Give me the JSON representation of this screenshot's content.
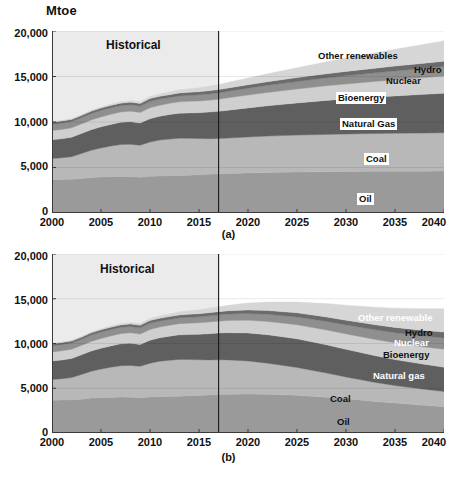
{
  "figure": {
    "unit_label": "Mtoe",
    "historical_label": "Historical",
    "captions": {
      "a": "(a)",
      "b": "(b)"
    }
  },
  "chart_data": [
    {
      "id": "panel-a",
      "type": "area",
      "stacked": true,
      "title": "",
      "caption": "(a)",
      "xlabel": "",
      "ylabel": "Mtoe",
      "unit": "Mtoe",
      "xlim": [
        2000,
        2040
      ],
      "ylim": [
        0,
        20000
      ],
      "yticks": [
        0,
        5000,
        10000,
        15000,
        20000
      ],
      "ytick_labels": [
        "0",
        "5,000",
        "10,000",
        "15,000",
        "20,000"
      ],
      "xticks": [
        2000,
        2005,
        2010,
        2015,
        2020,
        2025,
        2030,
        2035,
        2040
      ],
      "xtick_labels": [
        "2000",
        "2005",
        "2010",
        "2015",
        "2020",
        "2025",
        "2030",
        "2035",
        "2040"
      ],
      "grid": false,
      "legend_position": "inline-annotations",
      "historical_divider_year": 2017,
      "historical_shading": true,
      "x": [
        2000,
        2001,
        2002,
        2003,
        2004,
        2005,
        2006,
        2007,
        2008,
        2009,
        2010,
        2011,
        2012,
        2013,
        2014,
        2015,
        2016,
        2017,
        2018,
        2020,
        2022,
        2025,
        2028,
        2030,
        2033,
        2035,
        2038,
        2040
      ],
      "series": [
        {
          "name": "Oil",
          "color": "#9a9a9a",
          "label_anchor": {
            "x": 2028,
            "y": 1800
          },
          "values": [
            3660,
            3690,
            3710,
            3780,
            3900,
            3950,
            3980,
            4010,
            3990,
            3930,
            4030,
            4060,
            4090,
            4120,
            4160,
            4200,
            4250,
            4300,
            4340,
            4400,
            4450,
            4500,
            4540,
            4560,
            4580,
            4590,
            4600,
            4620
          ]
        },
        {
          "name": "Coal",
          "color": "#b8b8b8",
          "label_anchor": {
            "x": 2029,
            "y": 6500
          },
          "values": [
            2320,
            2370,
            2480,
            2750,
            2990,
            3190,
            3370,
            3510,
            3560,
            3520,
            3760,
            3960,
            4030,
            4100,
            4050,
            3980,
            3920,
            3880,
            3900,
            3950,
            4000,
            4060,
            4100,
            4120,
            4150,
            4170,
            4190,
            4200
          ]
        },
        {
          "name": "Natural Gas",
          "color": "#5f5f5f",
          "label_anchor": {
            "x": 2027,
            "y": 10000
          },
          "values": [
            2070,
            2100,
            2140,
            2200,
            2270,
            2330,
            2380,
            2450,
            2490,
            2440,
            2580,
            2620,
            2700,
            2750,
            2790,
            2840,
            2920,
            2990,
            3060,
            3200,
            3340,
            3530,
            3730,
            3850,
            4010,
            4110,
            4250,
            4340
          ]
        },
        {
          "name": "Bioenergy",
          "color": "#cfcfcf",
          "label_anchor": {
            "x": 2026,
            "y": 12600
          },
          "values": [
            1010,
            1020,
            1030,
            1050,
            1070,
            1090,
            1110,
            1130,
            1150,
            1160,
            1190,
            1210,
            1230,
            1250,
            1270,
            1290,
            1310,
            1330,
            1360,
            1410,
            1460,
            1530,
            1600,
            1650,
            1720,
            1770,
            1840,
            1890
          ]
        },
        {
          "name": "Nuclear",
          "color": "#8f8f8f",
          "label_anchor": {
            "x": 2032,
            "y": 14300
          },
          "values": [
            676,
            690,
            692,
            687,
            714,
            721,
            728,
            709,
            712,
            703,
            719,
            674,
            642,
            646,
            662,
            679,
            688,
            700,
            715,
            745,
            775,
            820,
            865,
            895,
            940,
            970,
            1015,
            1045
          ]
        },
        {
          "name": "Hydro",
          "color": "#6b6b6b",
          "label_anchor": {
            "x": 2036,
            "y": 15400
          },
          "values": [
            225,
            229,
            232,
            238,
            245,
            251,
            258,
            265,
            276,
            281,
            295,
            298,
            314,
            326,
            335,
            340,
            349,
            358,
            368,
            388,
            408,
            438,
            468,
            488,
            518,
            538,
            568,
            588
          ]
        },
        {
          "name": "Other renewables",
          "color": "#d6d6d6",
          "label_anchor": {
            "x": 2025,
            "y": 16100
          },
          "values": [
            60,
            66,
            73,
            82,
            93,
            106,
            122,
            143,
            167,
            193,
            225,
            262,
            302,
            345,
            392,
            442,
            496,
            552,
            615,
            745,
            880,
            1090,
            1310,
            1460,
            1690,
            1845,
            2080,
            2240
          ]
        }
      ],
      "totals_note": "Total primary energy demand rises from about 9,980 Mtoe in 2000 to about 17,520 Mtoe in 2040",
      "annotations": [
        {
          "text": "Historical",
          "x": 2007,
          "y": 18600
        },
        {
          "text": "Other renewables",
          "x": 2027,
          "y": 16400
        },
        {
          "text": "Hydro",
          "x": 2038,
          "y": 15900
        },
        {
          "text": "Nuclear",
          "x": 2035,
          "y": 14900
        },
        {
          "text": "Bioenergy",
          "x": 2027,
          "y": 13000
        },
        {
          "text": "Natural Gas",
          "x": 2028,
          "y": 10300
        },
        {
          "text": "Coal",
          "x": 2031,
          "y": 6600
        },
        {
          "text": "Oil",
          "x": 2031,
          "y": 1900
        }
      ]
    },
    {
      "id": "panel-b",
      "type": "area",
      "stacked": true,
      "title": "",
      "caption": "(b)",
      "xlabel": "",
      "ylabel": "Mtoe",
      "unit": "Mtoe",
      "xlim": [
        2000,
        2040
      ],
      "ylim": [
        0,
        20000
      ],
      "yticks": [
        0,
        5000,
        10000,
        15000,
        20000
      ],
      "ytick_labels": [
        "0",
        "5,000",
        "10,000",
        "15,000",
        "20,000"
      ],
      "xticks": [
        2000,
        2005,
        2010,
        2015,
        2020,
        2025,
        2030,
        2035,
        2040
      ],
      "xtick_labels": [
        "2000",
        "2005",
        "2010",
        "2015",
        "2020",
        "2025",
        "2030",
        "2035",
        "2040"
      ],
      "grid": false,
      "legend_position": "inline-annotations",
      "historical_divider_year": 2017,
      "historical_shading": true,
      "x": [
        2000,
        2001,
        2002,
        2003,
        2004,
        2005,
        2006,
        2007,
        2008,
        2009,
        2010,
        2011,
        2012,
        2013,
        2014,
        2015,
        2016,
        2017,
        2018,
        2020,
        2022,
        2025,
        2028,
        2030,
        2033,
        2035,
        2038,
        2040
      ],
      "series": [
        {
          "name": "Oil",
          "color": "#9a9a9a",
          "label_anchor": {
            "x": 2028,
            "y": 1700
          },
          "values": [
            3660,
            3690,
            3710,
            3780,
            3900,
            3950,
            3980,
            4010,
            3990,
            3930,
            4030,
            4060,
            4090,
            4120,
            4160,
            4200,
            4250,
            4300,
            4330,
            4350,
            4320,
            4220,
            4000,
            3820,
            3530,
            3350,
            3100,
            2930
          ]
        },
        {
          "name": "Coal",
          "color": "#b8b8b8",
          "label_anchor": {
            "x": 2027,
            "y": 5700
          },
          "values": [
            2320,
            2370,
            2480,
            2750,
            2990,
            3190,
            3370,
            3510,
            3560,
            3520,
            3760,
            3960,
            4030,
            4100,
            4050,
            3980,
            3920,
            3880,
            3840,
            3700,
            3480,
            3100,
            2700,
            2440,
            2120,
            1950,
            1780,
            1700
          ]
        },
        {
          "name": "Natural Gas",
          "color": "#5f5f5f",
          "label_anchor": {
            "x": 2029,
            "y": 6800
          },
          "values": [
            2070,
            2100,
            2140,
            2200,
            2270,
            2330,
            2380,
            2450,
            2490,
            2440,
            2580,
            2620,
            2700,
            2750,
            2790,
            2840,
            2920,
            2990,
            3040,
            3130,
            3180,
            3200,
            3150,
            3090,
            2980,
            2900,
            2790,
            2720
          ]
        },
        {
          "name": "Bioenergy",
          "color": "#cfcfcf",
          "label_anchor": {
            "x": 2031,
            "y": 10700
          },
          "values": [
            1010,
            1020,
            1030,
            1050,
            1070,
            1090,
            1110,
            1130,
            1150,
            1160,
            1190,
            1210,
            1230,
            1250,
            1270,
            1290,
            1310,
            1330,
            1360,
            1420,
            1480,
            1570,
            1660,
            1720,
            1810,
            1870,
            1950,
            2010
          ]
        },
        {
          "name": "Nuclear",
          "color": "#8f8f8f",
          "label_anchor": {
            "x": 2033,
            "y": 11700
          },
          "values": [
            676,
            690,
            692,
            687,
            714,
            721,
            728,
            709,
            712,
            703,
            719,
            674,
            642,
            646,
            662,
            679,
            688,
            700,
            720,
            760,
            810,
            880,
            960,
            1010,
            1090,
            1140,
            1210,
            1260
          ]
        },
        {
          "name": "Hydro",
          "color": "#6b6b6b",
          "label_anchor": {
            "x": 2035,
            "y": 12600
          },
          "values": [
            225,
            229,
            232,
            238,
            245,
            251,
            258,
            265,
            276,
            281,
            295,
            298,
            314,
            326,
            335,
            340,
            349,
            358,
            370,
            395,
            420,
            460,
            500,
            525,
            565,
            590,
            630,
            655
          ]
        },
        {
          "name": "Other renewable",
          "color": "#d6d6d6",
          "label_anchor": {
            "x": 2032,
            "y": 13300
          },
          "values": [
            60,
            66,
            73,
            82,
            93,
            106,
            122,
            143,
            167,
            193,
            225,
            262,
            302,
            345,
            392,
            442,
            496,
            552,
            620,
            780,
            950,
            1210,
            1490,
            1680,
            1960,
            2150,
            2430,
            2620
          ]
        }
      ],
      "totals_note": "Total primary energy demand peaks near 14,050 Mtoe around 2025 and falls to about 13,900 Mtoe by 2040",
      "annotations": [
        {
          "text": "Historical",
          "x": 2007,
          "y": 18600
        },
        {
          "text": "Other renewable",
          "x": 2033,
          "y": 13400
        },
        {
          "text": "Hydro",
          "x": 2036,
          "y": 12350
        },
        {
          "text": "Nuclear",
          "x": 2036,
          "y": 11500
        },
        {
          "text": "Bioenergy",
          "x": 2035,
          "y": 10600
        },
        {
          "text": "Natural gas",
          "x": 2034,
          "y": 8000
        },
        {
          "text": "Coal",
          "x": 2030,
          "y": 5100
        },
        {
          "text": "Oil",
          "x": 2030,
          "y": 1700
        }
      ]
    }
  ]
}
